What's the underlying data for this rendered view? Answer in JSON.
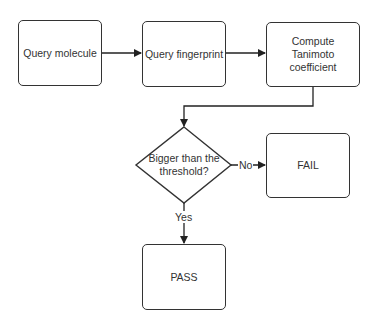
{
  "nodes": {
    "query_molecule": "Query molecule",
    "query_fingerprint": "Query fingerprint",
    "compute_line1": "Compute",
    "compute_line2": "Tanimoto coefficient",
    "decision_line1": "Bigger than the",
    "decision_line2": "threshold?",
    "fail": "FAIL",
    "pass": "PASS"
  },
  "edges": {
    "no_label": "No",
    "yes_label": "Yes"
  },
  "colors": {
    "stroke": "#333333",
    "background": "#ffffff"
  }
}
